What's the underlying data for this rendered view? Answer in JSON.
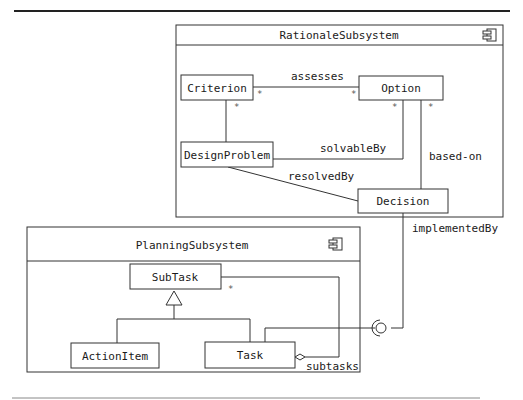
{
  "diagram": {
    "type": "uml-component-class-diagram",
    "subsystems": [
      {
        "id": "rationale",
        "name": "RationaleSubsystem",
        "icon": "component-icon",
        "classes": [
          {
            "id": "criterion",
            "name": "Criterion"
          },
          {
            "id": "option",
            "name": "Option"
          },
          {
            "id": "designproblem",
            "name": "DesignProblem"
          },
          {
            "id": "decision",
            "name": "Decision"
          }
        ]
      },
      {
        "id": "planning",
        "name": "PlanningSubsystem",
        "icon": "component-icon",
        "classes": [
          {
            "id": "subtask",
            "name": "SubTask"
          },
          {
            "id": "actionitem",
            "name": "ActionItem"
          },
          {
            "id": "task",
            "name": "Task"
          }
        ]
      }
    ],
    "associations": [
      {
        "from": "Criterion",
        "to": "Option",
        "label": "assesses",
        "from_mult": "*",
        "to_mult": "*"
      },
      {
        "from": "Criterion",
        "to": "DesignProblem",
        "label": "",
        "from_mult": "*",
        "to_mult": ""
      },
      {
        "from": "DesignProblem",
        "to": "Option",
        "label": "solvableBy",
        "from_mult": "",
        "to_mult": "*"
      },
      {
        "from": "Option",
        "to": "Decision",
        "label": "based-on",
        "from_mult": "*",
        "to_mult": ""
      },
      {
        "from": "DesignProblem",
        "to": "Decision",
        "label": "resolvedBy",
        "from_mult": "",
        "to_mult": ""
      },
      {
        "from": "Task",
        "to": "SubTask",
        "label": "subtasks",
        "kind": "aggregation",
        "to_mult": "*"
      },
      {
        "from": "ActionItem",
        "to": "SubTask",
        "kind": "generalization"
      },
      {
        "from": "Task",
        "to": "SubTask",
        "kind": "generalization"
      },
      {
        "from": "Decision",
        "to": "Task",
        "label": "implementedBy",
        "kind": "interface-socket"
      }
    ],
    "labels": {
      "rationale_title": "RationaleSubsystem",
      "planning_title": "PlanningSubsystem",
      "criterion": "Criterion",
      "option": "Option",
      "designproblem": "DesignProblem",
      "decision": "Decision",
      "subtask": "SubTask",
      "actionitem": "ActionItem",
      "task": "Task",
      "assesses": "assesses",
      "solvableBy": "solvableBy",
      "based_on": "based-on",
      "resolvedBy": "resolvedBy",
      "implementedBy": "implementedBy",
      "subtasks": "subtasks",
      "star": "*"
    }
  }
}
